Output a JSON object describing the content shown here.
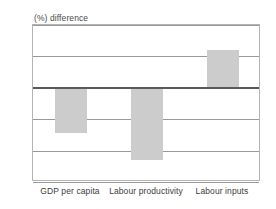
{
  "chart_data": {
    "type": "bar",
    "title": "(%) difference",
    "xlabel": "",
    "ylabel": "(%) difference",
    "categories": [
      "GDP per capita",
      "Labour productivity",
      "Labour inputs"
    ],
    "values": [
      -29,
      -46,
      24
    ],
    "ylim": [
      -60,
      40
    ],
    "yticks": [
      40,
      20,
      0,
      -20,
      -40,
      -60
    ],
    "ytick_labels": [
      "40",
      "20",
      "0",
      "-20",
      "-40",
      "-60"
    ],
    "grid": true,
    "legend": false,
    "zero_line": true,
    "series": [
      {
        "name": "(%) difference",
        "values": [
          -29,
          -46,
          24
        ]
      }
    ],
    "colors": {
      "bar_fill": "#cccccc",
      "gridline": "#9a9a9a",
      "zero_line": "#5a5a5a",
      "frame": "#b4b4b4",
      "text": "#3c3c3c",
      "background": "#ffffff"
    }
  }
}
